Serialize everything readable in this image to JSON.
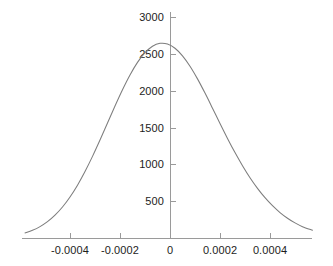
{
  "chart_data": {
    "type": "line",
    "title": "",
    "subtitle": "",
    "xlabel": "",
    "ylabel": "",
    "grid": false,
    "legend": false,
    "legend_position": "none",
    "curve_shape": "gaussian",
    "peak_value": 2900,
    "peak_x": -1e-05,
    "sigma": 0.00022,
    "xlim": [
      -0.00058,
      0.00057
    ],
    "ylim": [
      0,
      3050
    ],
    "xticks": [
      -0.0004,
      -0.0002,
      0,
      0.0002,
      0.0004
    ],
    "xticklabels": [
      "-0.0004",
      "-0.0002",
      "0",
      "0.0002",
      "0.0004"
    ],
    "yticks": [
      500,
      1000,
      1500,
      2000,
      2500,
      3000
    ],
    "yticklabels": [
      "500",
      "1000",
      "1500",
      "2000",
      "2500",
      "3000"
    ],
    "series": [
      {
        "name": "gaussian",
        "color": "#7d7d7d",
        "x": [
          -0.00058,
          -0.00055,
          -0.00052,
          -0.00049,
          -0.00046,
          -0.00043,
          -0.0004,
          -0.00037,
          -0.00034,
          -0.00031,
          -0.00028,
          -0.00025,
          -0.00022,
          -0.00019,
          -0.00016,
          -0.00013,
          -0.0001,
          -7e-05,
          -4e-05,
          -1e-05,
          2e-05,
          5e-05,
          8e-05,
          0.00011,
          0.00014,
          0.00017,
          0.0002,
          0.00023,
          0.00026,
          0.00029,
          0.00032,
          0.00035,
          0.00038,
          0.00041,
          0.00044,
          0.00047,
          0.0005,
          0.00053,
          0.00057
        ],
        "values": [
          69,
          105,
          155,
          222,
          310,
          421,
          557,
          718,
          903,
          1109,
          1331,
          1562,
          1793,
          2014,
          2215,
          2386,
          2518,
          2606,
          2645,
          2636,
          2578,
          2475,
          2334,
          2162,
          1969,
          1764,
          1556,
          1353,
          1160,
          982,
          819,
          675,
          548,
          439,
          346,
          269,
          205,
          154,
          106
        ]
      }
    ],
    "axis_color": "#9a9a9a",
    "background_color": "#ffffff"
  },
  "geometry": {
    "x_axis_y_px": 238,
    "x_axis_left_px": 22,
    "x_axis_right_px": 312,
    "y_axis_x_px": 170,
    "y_axis_top_px": 12,
    "px_per_x_unit": 250000,
    "px_per_y_unit": 0.0736,
    "tick_length_px": 5
  }
}
